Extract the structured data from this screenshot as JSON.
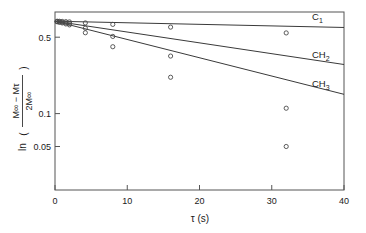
{
  "chart_data": {
    "type": "line",
    "title": "",
    "subtitle": "",
    "xlabel": "τ (s)",
    "ylabel": "ln((M∞ − Mτ)/(2M∞))",
    "ylabel_parts": {
      "prefix": "ln",
      "numerator": "M∞ − Mτ",
      "denominator": "2M∞",
      "open_paren": "(",
      "close_paren": ")"
    },
    "yscale": "log",
    "xscale": "linear",
    "xlim": [
      0,
      40
    ],
    "ylim": [
      0.02,
      0.85
    ],
    "grid": false,
    "legend_position": "inline-right",
    "xticks": [
      0,
      10,
      20,
      30,
      40
    ],
    "xtick_labels": [
      "0",
      "10",
      "20",
      "30",
      "40"
    ],
    "yticks": [
      0.5,
      0.1,
      0.05
    ],
    "ytick_labels": [
      "0.5",
      "0.1",
      "0.05"
    ],
    "marker": "open-circle",
    "series": [
      {
        "name": "C1",
        "label": "C₁",
        "label_main": "C",
        "label_sub": "1",
        "fit_intercept": 0.7,
        "fit_slope_per_s": -0.0033,
        "x": [
          0.3,
          0.6,
          1.0,
          1.5,
          2.0,
          4.2,
          8.0,
          16.0,
          32.0
        ],
        "y": [
          0.7,
          0.699,
          0.697,
          0.694,
          0.69,
          0.675,
          0.655,
          0.618,
          0.547
        ]
      },
      {
        "name": "CH2",
        "label": "CH₂",
        "label_main": "CH",
        "label_sub": "2",
        "fit_intercept": 0.7,
        "fit_slope_per_s": -0.0228,
        "x": [
          0.3,
          0.6,
          1.0,
          1.5,
          2.0,
          4.2,
          8.0,
          16.0,
          32.0
        ],
        "y": [
          0.695,
          0.69,
          0.684,
          0.676,
          0.668,
          0.605,
          0.508,
          0.336,
          0.112
        ]
      },
      {
        "name": "CH3",
        "label": "CH₃",
        "label_main": "CH",
        "label_sub": "3",
        "fit_intercept": 0.7,
        "fit_slope_per_s": -0.0385,
        "x": [
          0.3,
          0.6,
          1.0,
          1.5,
          2.0,
          4.2,
          8.0,
          16.0,
          32.0
        ],
        "y": [
          0.692,
          0.685,
          0.675,
          0.661,
          0.648,
          0.549,
          0.409,
          0.215,
          0.05
        ]
      }
    ],
    "annotations": [
      {
        "text": "outlier",
        "series": "CH3",
        "x": 32.0,
        "y": 0.05
      }
    ]
  },
  "axes": {
    "x_axis_name": "tau-axis",
    "y_axis_name": "ln-ratio-axis"
  }
}
